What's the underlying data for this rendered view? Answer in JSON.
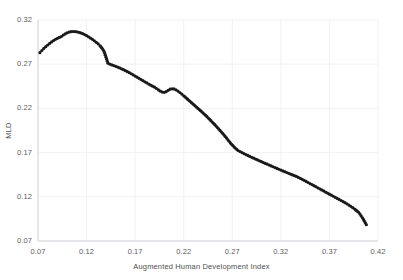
{
  "chart_data": {
    "type": "line",
    "title": "",
    "xlabel": "Augmented Human Development Index",
    "ylabel": "MLD",
    "xlim": [
      0.07,
      0.42
    ],
    "ylim": [
      0.07,
      0.32
    ],
    "xticks": [
      "0.07",
      "0.12",
      "0.17",
      "0.22",
      "0.27",
      "0.32",
      "0.37",
      "0.42"
    ],
    "yticks": [
      "0.07",
      "0.12",
      "0.17",
      "0.22",
      "0.27",
      "0.32"
    ],
    "xtick_values": [
      0.07,
      0.12,
      0.17,
      0.22,
      0.27,
      0.32,
      0.37,
      0.42
    ],
    "ytick_values": [
      0.07,
      0.12,
      0.17,
      0.22,
      0.27,
      0.32
    ],
    "grid": true,
    "grid_color": "#ededf2",
    "legend": "none",
    "marker": "circle",
    "marker_color": "#1a1a1a",
    "marker_size": 1.6,
    "line_color": "#1a1a1a",
    "series": [
      {
        "name": "MLD",
        "x": [
          0.072,
          0.074,
          0.076,
          0.078,
          0.08,
          0.082,
          0.084,
          0.086,
          0.088,
          0.09,
          0.092,
          0.094,
          0.096,
          0.098,
          0.1,
          0.102,
          0.104,
          0.106,
          0.108,
          0.11,
          0.112,
          0.114,
          0.116,
          0.118,
          0.12,
          0.122,
          0.124,
          0.126,
          0.128,
          0.13,
          0.132,
          0.134,
          0.136,
          0.138,
          0.14,
          0.142,
          0.144,
          0.146,
          0.148,
          0.15,
          0.152,
          0.154,
          0.156,
          0.158,
          0.16,
          0.162,
          0.164,
          0.166,
          0.168,
          0.17,
          0.172,
          0.174,
          0.176,
          0.178,
          0.18,
          0.182,
          0.184,
          0.186,
          0.188,
          0.19,
          0.192,
          0.194,
          0.196,
          0.198,
          0.2,
          0.202,
          0.204,
          0.206,
          0.208,
          0.21,
          0.212,
          0.214,
          0.216,
          0.218,
          0.22,
          0.224,
          0.228,
          0.232,
          0.236,
          0.24,
          0.244,
          0.248,
          0.252,
          0.256,
          0.26,
          0.264,
          0.268,
          0.272,
          0.276,
          0.28,
          0.284,
          0.288,
          0.292,
          0.296,
          0.3,
          0.304,
          0.308,
          0.312,
          0.316,
          0.32,
          0.324,
          0.328,
          0.332,
          0.336,
          0.34,
          0.344,
          0.348,
          0.352,
          0.356,
          0.36,
          0.364,
          0.368,
          0.372,
          0.376,
          0.38,
          0.384,
          0.388,
          0.392,
          0.396,
          0.4,
          0.404,
          0.408
        ],
        "y": [
          0.283,
          0.2855,
          0.2878,
          0.2898,
          0.2917,
          0.2935,
          0.2952,
          0.2967,
          0.2981,
          0.2993,
          0.3003,
          0.3012,
          0.3029,
          0.3042,
          0.3055,
          0.3063,
          0.3068,
          0.307,
          0.3069,
          0.3066,
          0.3061,
          0.3054,
          0.3045,
          0.3035,
          0.3023,
          0.301,
          0.2996,
          0.2981,
          0.2965,
          0.2948,
          0.2929,
          0.2907,
          0.288,
          0.2845,
          0.278,
          0.2712,
          0.27,
          0.2692,
          0.2684,
          0.2676,
          0.2667,
          0.2658,
          0.2648,
          0.2638,
          0.2627,
          0.2616,
          0.2604,
          0.2592,
          0.2579,
          0.2566,
          0.2553,
          0.254,
          0.2527,
          0.2514,
          0.2501,
          0.2488,
          0.2475,
          0.2463,
          0.2451,
          0.244,
          0.2425,
          0.2409,
          0.2395,
          0.2385,
          0.2382,
          0.239,
          0.2404,
          0.2417,
          0.2422,
          0.242,
          0.241,
          0.2396,
          0.238,
          0.2362,
          0.2343,
          0.2304,
          0.2265,
          0.2226,
          0.2187,
          0.2148,
          0.2106,
          0.2061,
          0.2016,
          0.1968,
          0.1918,
          0.1866,
          0.181,
          0.1762,
          0.1723,
          0.17,
          0.1678,
          0.1657,
          0.1637,
          0.1617,
          0.1597,
          0.1578,
          0.1559,
          0.154,
          0.1521,
          0.1502,
          0.1484,
          0.1466,
          0.1448,
          0.143,
          0.1409,
          0.1386,
          0.1362,
          0.1338,
          0.1314,
          0.129,
          0.1266,
          0.1242,
          0.1218,
          0.1194,
          0.117,
          0.1146,
          0.112,
          0.1092,
          0.1061,
          0.1025,
          0.0963,
          0.0885
        ]
      }
    ]
  }
}
